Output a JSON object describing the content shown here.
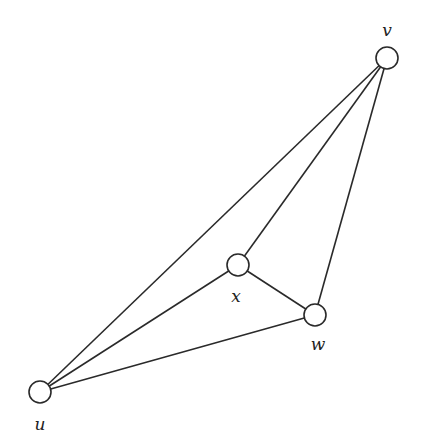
{
  "diagram": {
    "type": "graph",
    "width": 422,
    "height": 441,
    "node_radius": 11,
    "colors": {
      "stroke": "#2a2a2a",
      "node_fill": "#ffffff",
      "label": "#222222",
      "background": "#ffffff"
    },
    "nodes": [
      {
        "id": "v",
        "label": "v",
        "cx": 387,
        "cy": 58,
        "lx": 387,
        "ly": 36
      },
      {
        "id": "x",
        "label": "x",
        "cx": 238,
        "cy": 265,
        "lx": 236,
        "ly": 302
      },
      {
        "id": "w",
        "label": "w",
        "cx": 315,
        "cy": 315,
        "lx": 318,
        "ly": 350
      },
      {
        "id": "u",
        "label": "u",
        "cx": 40,
        "cy": 392,
        "lx": 40,
        "ly": 430
      }
    ],
    "edges": [
      {
        "from": "u",
        "to": "v"
      },
      {
        "from": "u",
        "to": "x"
      },
      {
        "from": "u",
        "to": "w"
      },
      {
        "from": "x",
        "to": "v"
      },
      {
        "from": "x",
        "to": "w"
      },
      {
        "from": "w",
        "to": "v"
      }
    ]
  }
}
